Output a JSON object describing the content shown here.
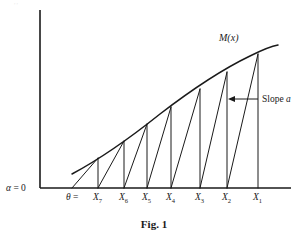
{
  "figure": {
    "caption": "Fig. 1",
    "curve_label": "M(x)",
    "slope_annotation": {
      "prefix": "Slope ",
      "symbol": "a"
    },
    "origin_label": {
      "alpha": "α",
      "equals": " = 0"
    },
    "theta_label": {
      "symbol": "θ",
      "equals": " ="
    },
    "colors": {
      "ink": "#1a1a1a",
      "background": "#ffffff",
      "bleed": "#e8e8e8"
    },
    "axes": {
      "x_axis_y": 188,
      "y_axis_x": 40,
      "y_axis_top": 10,
      "x_axis_right": 291
    },
    "ticks": [
      {
        "base": "X",
        "sub": "7",
        "x": 98
      },
      {
        "base": "X",
        "sub": "6",
        "x": 124
      },
      {
        "base": "X",
        "sub": "5",
        "x": 147
      },
      {
        "base": "X",
        "sub": "4",
        "x": 171
      },
      {
        "base": "X",
        "sub": "3",
        "x": 200
      },
      {
        "base": "X",
        "sub": "2",
        "x": 227
      },
      {
        "base": "X",
        "sub": "1",
        "x": 258
      }
    ]
  },
  "chart_data": {
    "type": "line",
    "title": "Fig. 1",
    "xlabel": "",
    "ylabel": "",
    "grid": false,
    "legend": "none",
    "annotations": [
      {
        "text": "M(x)",
        "x": 232,
        "y": 38,
        "role": "curve-label"
      },
      {
        "text": "Slope a",
        "x": 262,
        "y": 100,
        "role": "slope-annotation"
      },
      {
        "text": "α = 0",
        "x": 18,
        "y": 190,
        "role": "axis-origin-label"
      },
      {
        "text": "θ =",
        "x": 73,
        "y": 200,
        "role": "theta-label"
      }
    ],
    "series": [
      {
        "name": "M(x)",
        "type": "curve",
        "points": [
          [
            72,
            174
          ],
          [
            85,
            166
          ],
          [
            98,
            158
          ],
          [
            112,
            149
          ],
          [
            124,
            141
          ],
          [
            136,
            132
          ],
          [
            147,
            124
          ],
          [
            159,
            115
          ],
          [
            171,
            107
          ],
          [
            183,
            99
          ],
          [
            196,
            91
          ],
          [
            208,
            83
          ],
          [
            221,
            75
          ],
          [
            233,
            67
          ],
          [
            245,
            60
          ],
          [
            258,
            54
          ],
          [
            268,
            49
          ],
          [
            278,
            45
          ]
        ]
      },
      {
        "name": "staircase",
        "type": "polyline-segments",
        "segments": [
          {
            "from": [
              72,
              188
            ],
            "to": [
              98,
              158
            ],
            "kind": "diagonal"
          },
          {
            "from": [
              98,
              158
            ],
            "to": [
              98,
              188
            ],
            "kind": "vertical"
          },
          {
            "from": [
              98,
              188
            ],
            "to": [
              124,
              141
            ],
            "kind": "diagonal"
          },
          {
            "from": [
              124,
              141
            ],
            "to": [
              124,
              188
            ],
            "kind": "vertical"
          },
          {
            "from": [
              124,
              188
            ],
            "to": [
              147,
              124
            ],
            "kind": "diagonal"
          },
          {
            "from": [
              147,
              124
            ],
            "to": [
              147,
              188
            ],
            "kind": "vertical"
          },
          {
            "from": [
              147,
              188
            ],
            "to": [
              171,
              107
            ],
            "kind": "diagonal"
          },
          {
            "from": [
              171,
              107
            ],
            "to": [
              171,
              188
            ],
            "kind": "vertical"
          },
          {
            "from": [
              171,
              188
            ],
            "to": [
              200,
              89
            ],
            "kind": "diagonal"
          },
          {
            "from": [
              200,
              89
            ],
            "to": [
              200,
              188
            ],
            "kind": "vertical"
          },
          {
            "from": [
              200,
              188
            ],
            "to": [
              227,
              72
            ],
            "kind": "diagonal"
          },
          {
            "from": [
              227,
              72
            ],
            "to": [
              227,
              188
            ],
            "kind": "vertical"
          },
          {
            "from": [
              227,
              188
            ],
            "to": [
              258,
              54
            ],
            "kind": "diagonal"
          },
          {
            "from": [
              258,
              54
            ],
            "to": [
              258,
              188
            ],
            "kind": "vertical"
          }
        ]
      }
    ],
    "x_values_order": [
      "θ",
      "X7",
      "X6",
      "X5",
      "X4",
      "X3",
      "X2",
      "X1"
    ]
  }
}
